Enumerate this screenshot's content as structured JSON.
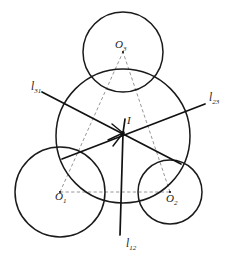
{
  "figure": {
    "type": "geometric-diagram",
    "background_color": "#ffffff",
    "stroke_color": "#1a1a1a",
    "dashed_color": "#8a8a8a"
  },
  "labels": {
    "center": {
      "text": "I",
      "sub": "",
      "x": 127,
      "y": 124
    },
    "o1": {
      "text": "O",
      "sub": "1",
      "x": 55,
      "y": 200
    },
    "o2": {
      "text": "O",
      "sub": "2",
      "x": 166,
      "y": 202
    },
    "o3": {
      "text": "O",
      "sub": "3",
      "x": 115,
      "y": 48
    },
    "l31": {
      "text": "l",
      "sub": "31",
      "x": 31,
      "y": 90
    },
    "l23": {
      "text": "l",
      "sub": "23",
      "x": 209,
      "y": 101
    },
    "l12": {
      "text": "l",
      "sub": "12",
      "x": 126,
      "y": 247
    }
  },
  "circles": [
    {
      "name": "circle-o3-top",
      "cx": 123,
      "cy": 52,
      "r": 40
    },
    {
      "name": "circle-main-middle",
      "cx": 123,
      "cy": 136,
      "r": 67
    },
    {
      "name": "circle-o1-left",
      "cx": 60,
      "cy": 192,
      "r": 45
    },
    {
      "name": "circle-o2-right",
      "cx": 170,
      "cy": 192,
      "r": 32
    }
  ],
  "radical_center": {
    "x": 123,
    "y": 133
  },
  "radical_axes": [
    {
      "name": "axis-l31",
      "x1": 42,
      "y1": 92,
      "x2": 181,
      "y2": 164
    },
    {
      "name": "axis-l23",
      "x1": 62,
      "y1": 159,
      "x2": 205,
      "y2": 104
    },
    {
      "name": "axis-l12",
      "x1": 120,
      "y1": 235,
      "x2": 123,
      "y2": 133
    }
  ],
  "center_triangle": [
    {
      "name": "side-o1-o2",
      "x1": 60,
      "y1": 192,
      "x2": 170,
      "y2": 192
    },
    {
      "name": "side-o1-o3",
      "x1": 60,
      "y1": 192,
      "x2": 123,
      "y2": 52
    },
    {
      "name": "side-o2-o3",
      "x1": 170,
      "y1": 192,
      "x2": 123,
      "y2": 52
    }
  ],
  "center_dots": [
    {
      "name": "dot-o3",
      "cx": 123,
      "cy": 52
    },
    {
      "name": "dot-o1",
      "cx": 60,
      "cy": 192
    },
    {
      "name": "dot-o2",
      "cx": 170,
      "cy": 192
    },
    {
      "name": "dot-incenter",
      "cx": 123,
      "cy": 133
    }
  ]
}
